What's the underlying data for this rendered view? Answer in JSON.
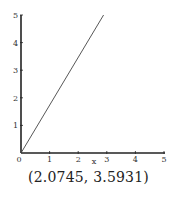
{
  "chart_data": {
    "type": "line",
    "title": "",
    "xlabel": "x",
    "ylabel": "",
    "xlim": [
      0,
      5
    ],
    "ylim": [
      0,
      5
    ],
    "xticks": [
      "0",
      "1",
      "2",
      "3",
      "4",
      "5"
    ],
    "yticks": [
      "1",
      "2",
      "3",
      "4",
      "5"
    ],
    "grid": false,
    "legend": null,
    "series": [
      {
        "name": "y = 1.732x",
        "x": [
          0,
          2.887
        ],
        "y": [
          0,
          5
        ],
        "color": "#444444"
      }
    ],
    "annotations": [
      {
        "text": "(2.0745, 3.5931)",
        "position": "below-plot"
      }
    ]
  },
  "caption": "(2.0745, 3.5931)",
  "colors": {
    "axis": "#222222",
    "line": "#444444",
    "text": "#333333"
  }
}
